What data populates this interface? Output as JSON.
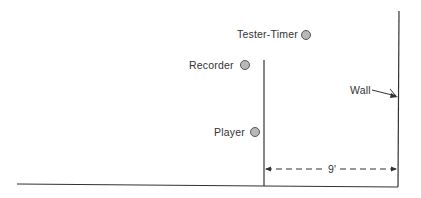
{
  "diagram": {
    "labels": {
      "tester_timer": "Tester-Timer",
      "recorder": "Recorder",
      "player": "Player",
      "wall": "Wall",
      "distance": "9'"
    },
    "colors": {
      "line": "#333333",
      "dot_fill": "#b8b8b8",
      "dot_stroke": "#555555"
    }
  }
}
